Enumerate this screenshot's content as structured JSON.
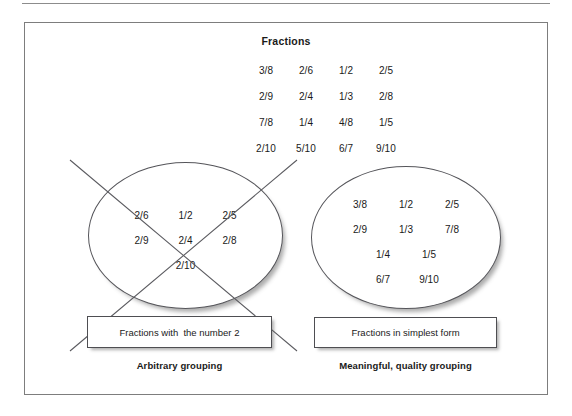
{
  "figure": {
    "pool": {
      "title": "Fractions",
      "rows": [
        [
          "3/8",
          "2/6",
          "1/2",
          "2/5"
        ],
        [
          "2/9",
          "2/4",
          "1/3",
          "2/8"
        ],
        [
          "7/8",
          "1/4",
          "4/8",
          "1/5"
        ],
        [
          "2/10",
          "5/10",
          "6/7",
          "9/10"
        ]
      ]
    },
    "groups": [
      {
        "id": "arbitrary",
        "rows": [
          [
            "2/6",
            "1/2",
            "2/5"
          ],
          [
            "2/9",
            "2/4",
            "2/8"
          ],
          [
            "2/10"
          ]
        ],
        "caption": "Fractions with  the number 2",
        "label": "Arbitrary grouping",
        "crossed_out": true
      },
      {
        "id": "meaningful",
        "rows": [
          [
            "3/8",
            "1/2",
            "2/5"
          ],
          [
            "2/9",
            "1/3",
            "7/8"
          ],
          [
            "1/4",
            "1/5"
          ],
          [
            "6/7",
            "9/10"
          ]
        ],
        "caption": "Fractions in simplest form",
        "label": "Meaningful, quality grouping",
        "crossed_out": false
      }
    ],
    "colors": {
      "line": "#55555a",
      "frame": "#7d7d7d",
      "rule": "#8c8c8c",
      "text": "#1a1a1a"
    }
  }
}
